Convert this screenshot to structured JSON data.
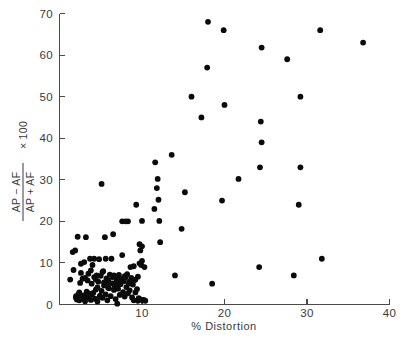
{
  "chart_data": {
    "type": "scatter",
    "title": "",
    "xlabel": "% Distortion",
    "ylabel_numerator": "AP − AF",
    "ylabel_denominator": "AP + AF",
    "ylabel_suffix": "× 100",
    "ylabel": "(AP − AF)/(AP + AF) × 100",
    "xlim": [
      0,
      40
    ],
    "ylim": [
      0,
      70
    ],
    "xticks": [
      0,
      10,
      20,
      30,
      40
    ],
    "yticks": [
      0,
      10,
      20,
      30,
      40,
      50,
      60,
      70
    ],
    "xtick_labels": [
      "0",
      "10",
      "20",
      "30",
      "40"
    ],
    "ytick_labels": [
      "0",
      "10",
      "20",
      "30",
      "40",
      "50",
      "60",
      "70"
    ],
    "grid": false,
    "legend": false,
    "marker": "filled-circle",
    "marker_color": "#0b0b0b",
    "marker_size_px": 4.0,
    "n_points": 148,
    "points": [
      [
        1.3,
        6.0
      ],
      [
        1.6,
        12.6
      ],
      [
        1.7,
        8.3
      ],
      [
        1.9,
        13.0
      ],
      [
        2.0,
        2.0
      ],
      [
        2.1,
        1.2
      ],
      [
        2.2,
        16.3
      ],
      [
        2.3,
        2.5
      ],
      [
        2.4,
        1.0
      ],
      [
        2.5,
        5.2
      ],
      [
        2.6,
        9.8
      ],
      [
        2.7,
        1.5
      ],
      [
        2.8,
        6.2
      ],
      [
        2.9,
        2.2
      ],
      [
        3.0,
        10.2
      ],
      [
        3.1,
        0.8
      ],
      [
        3.2,
        16.2
      ],
      [
        3.3,
        3.1
      ],
      [
        3.4,
        1.8
      ],
      [
        3.5,
        7.4
      ],
      [
        3.6,
        2.6
      ],
      [
        3.7,
        11.0
      ],
      [
        3.8,
        1.1
      ],
      [
        3.9,
        5.0
      ],
      [
        4.0,
        9.5
      ],
      [
        4.1,
        2.8
      ],
      [
        4.2,
        6.6
      ],
      [
        4.3,
        1.4
      ],
      [
        4.4,
        3.6
      ],
      [
        4.5,
        7.0
      ],
      [
        4.6,
        0.7
      ],
      [
        4.7,
        5.5
      ],
      [
        4.8,
        10.9
      ],
      [
        4.9,
        2.1
      ],
      [
        5.0,
        6.9
      ],
      [
        5.1,
        3.3
      ],
      [
        5.1,
        29.0
      ],
      [
        5.2,
        1.6
      ],
      [
        5.3,
        8.0
      ],
      [
        5.4,
        4.6
      ],
      [
        5.5,
        16.2
      ],
      [
        5.6,
        2.4
      ],
      [
        5.7,
        6.3
      ],
      [
        5.8,
        1.0
      ],
      [
        5.9,
        5.8
      ],
      [
        6.0,
        3.9
      ],
      [
        6.1,
        7.2
      ],
      [
        6.2,
        2.0
      ],
      [
        6.3,
        11.0
      ],
      [
        6.4,
        5.1
      ],
      [
        6.5,
        6.8
      ],
      [
        6.5,
        16.9
      ],
      [
        6.6,
        3.5
      ],
      [
        6.7,
        4.4
      ],
      [
        6.8,
        1.3
      ],
      [
        6.9,
        6.0
      ],
      [
        7.0,
        5.4
      ],
      [
        7.0,
        0.2
      ],
      [
        7.1,
        3.8
      ],
      [
        7.2,
        7.1
      ],
      [
        7.3,
        2.3
      ],
      [
        7.4,
        4.9
      ],
      [
        7.5,
        6.1
      ],
      [
        7.6,
        11.9
      ],
      [
        7.7,
        3.0
      ],
      [
        7.8,
        5.6
      ],
      [
        7.9,
        1.9
      ],
      [
        8.0,
        6.5
      ],
      [
        8.1,
        4.2
      ],
      [
        8.2,
        7.3
      ],
      [
        8.3,
        2.7
      ],
      [
        8.3,
        20.0
      ],
      [
        8.4,
        5.0
      ],
      [
        8.5,
        3.4
      ],
      [
        8.6,
        9.0
      ],
      [
        8.7,
        6.4
      ],
      [
        8.8,
        1.7
      ],
      [
        8.9,
        4.8
      ],
      [
        9.0,
        9.2
      ],
      [
        9.0,
        1.0
      ],
      [
        9.1,
        5.9
      ],
      [
        9.2,
        2.9
      ],
      [
        9.3,
        24.0
      ],
      [
        9.4,
        3.7
      ],
      [
        9.5,
        6.7
      ],
      [
        9.5,
        0.9
      ],
      [
        9.6,
        1.5
      ],
      [
        9.7,
        14.5
      ],
      [
        9.7,
        9.9
      ],
      [
        9.8,
        13.0
      ],
      [
        9.8,
        1.2
      ],
      [
        9.9,
        9.5
      ],
      [
        10.0,
        14.0
      ],
      [
        10.0,
        10.5
      ],
      [
        10.0,
        20.1
      ],
      [
        10.1,
        1.0
      ],
      [
        10.2,
        1.1
      ],
      [
        10.3,
        9.0
      ],
      [
        10.4,
        0.9
      ],
      [
        2.0,
        1.6
      ],
      [
        2.4,
        2.9
      ],
      [
        3.0,
        1.9
      ],
      [
        3.4,
        5.8
      ],
      [
        3.9,
        2.4
      ],
      [
        4.4,
        6.0
      ],
      [
        4.9,
        1.8
      ],
      [
        5.4,
        5.3
      ],
      [
        5.9,
        4.0
      ],
      [
        6.4,
        6.6
      ],
      [
        6.9,
        4.5
      ],
      [
        4.2,
        11.0
      ],
      [
        5.6,
        11.0
      ],
      [
        7.6,
        20.0
      ],
      [
        8.0,
        20.0
      ],
      [
        2.6,
        7.6
      ],
      [
        3.1,
        6.4
      ],
      [
        3.8,
        8.2
      ],
      [
        4.6,
        4.1
      ],
      [
        5.2,
        7.8
      ],
      [
        6.0,
        5.2
      ],
      [
        6.6,
        7.0
      ],
      [
        7.2,
        5.5
      ],
      [
        7.9,
        6.8
      ],
      [
        8.5,
        5.5
      ],
      [
        9.2,
        6.0
      ],
      [
        11.5,
        23.0
      ],
      [
        11.6,
        34.2
      ],
      [
        11.8,
        28.0
      ],
      [
        11.9,
        30.2
      ],
      [
        12.0,
        25.2
      ],
      [
        12.1,
        20.1
      ],
      [
        12.2,
        15.0
      ],
      [
        13.6,
        36.0
      ],
      [
        14.0,
        7.0
      ],
      [
        14.8,
        18.2
      ],
      [
        15.2,
        27.0
      ],
      [
        16.0,
        50.0
      ],
      [
        17.2,
        45.0
      ],
      [
        17.9,
        57.0
      ],
      [
        18.0,
        68.0
      ],
      [
        18.5,
        5.0
      ],
      [
        19.7,
        25.0
      ],
      [
        19.9,
        66.0
      ],
      [
        20.0,
        48.0
      ],
      [
        21.7,
        30.2
      ],
      [
        24.2,
        9.0
      ],
      [
        24.3,
        33.0
      ],
      [
        24.4,
        44.0
      ],
      [
        24.5,
        39.0
      ],
      [
        24.5,
        61.8
      ],
      [
        27.6,
        59.0
      ],
      [
        28.4,
        7.0
      ],
      [
        29.0,
        24.0
      ],
      [
        29.2,
        33.0
      ],
      [
        29.2,
        50.0
      ],
      [
        31.6,
        66.0
      ],
      [
        31.8,
        11.0
      ],
      [
        36.8,
        63.0
      ]
    ]
  },
  "figure": {
    "background_color": "#ffffff",
    "axis_color": "#4a4a4a",
    "text_color": "#3a3a3a"
  }
}
